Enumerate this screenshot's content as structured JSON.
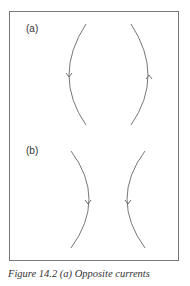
{
  "figure": {
    "panel_a_label": "(a)",
    "panel_b_label": "(b)",
    "caption": "Figure 14.2  (a) Opposite currents"
  }
}
